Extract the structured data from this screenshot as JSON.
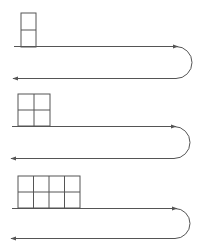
{
  "diagram": {
    "stroke_color": "#555555",
    "rows": [
      {
        "grid_cols": 1,
        "grid_rows": 2,
        "label": ""
      },
      {
        "grid_cols": 2,
        "grid_rows": 2,
        "label": ""
      },
      {
        "grid_cols": 4,
        "grid_rows": 2,
        "label": ""
      }
    ]
  }
}
